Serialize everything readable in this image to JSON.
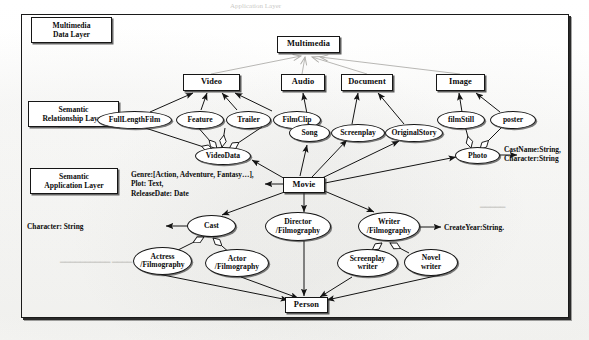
{
  "diagram": {
    "layers": [
      {
        "id": "data",
        "label": "Multimedia\nData Layer"
      },
      {
        "id": "relationship",
        "label": "Semantic\nRelationship Layer"
      },
      {
        "id": "application",
        "label": "Semantic\nApplication Layer"
      }
    ],
    "nodes": {
      "multimedia": {
        "label": "Multimedia",
        "shape": "box"
      },
      "video": {
        "label": "Video",
        "shape": "box"
      },
      "audio": {
        "label": "Audio",
        "shape": "box"
      },
      "document": {
        "label": "Document",
        "shape": "box"
      },
      "image": {
        "label": "Image",
        "shape": "box"
      },
      "fulllengthfilm": {
        "label": "FullLengthFilm",
        "shape": "ellipse"
      },
      "feature": {
        "label": "Feature",
        "shape": "ellipse"
      },
      "trailer": {
        "label": "Trailer",
        "shape": "ellipse"
      },
      "filmclip": {
        "label": "FilmClip",
        "shape": "ellipse"
      },
      "song": {
        "label": "Song",
        "shape": "ellipse"
      },
      "screenplay": {
        "label": "Screenplay",
        "shape": "ellipse"
      },
      "originalstory": {
        "label": "OriginalStory",
        "shape": "ellipse"
      },
      "filmstill": {
        "label": "filmStill",
        "shape": "ellipse"
      },
      "poster": {
        "label": "poster",
        "shape": "ellipse"
      },
      "videodata": {
        "label": "VideoData",
        "shape": "ellipse"
      },
      "photo": {
        "label": "Photo",
        "shape": "ellipse"
      },
      "movie": {
        "label": "Movie",
        "shape": "box"
      },
      "cast": {
        "label": "Cast",
        "shape": "ellipse"
      },
      "director": {
        "label": "Director\n/Filmography",
        "shape": "ellipse"
      },
      "writer": {
        "label": "Writer\n/Filmography",
        "shape": "ellipse"
      },
      "actress": {
        "label": "Actress\n/Filmography",
        "shape": "ellipse"
      },
      "actor": {
        "label": "Actor\n/Filmography",
        "shape": "ellipse"
      },
      "screenplaywriter": {
        "label": "Screenplay\nwriter",
        "shape": "ellipse"
      },
      "novelwriter": {
        "label": "Novel\nwriter",
        "shape": "ellipse"
      },
      "person": {
        "label": "Person",
        "shape": "box"
      }
    },
    "attributes": {
      "movie": {
        "label": "Genre:[Action, Adventure, Fantasy…],\nPlot: Text,\nReleaseDate: Date"
      },
      "cast": {
        "label": "Character: String"
      },
      "photo": {
        "label": "CastName:String,\nCharacter:String"
      },
      "writer": {
        "label": "CreateYear:String."
      }
    },
    "edges": [
      {
        "from": "video",
        "to": "multimedia",
        "kind": "generalization"
      },
      {
        "from": "audio",
        "to": "multimedia",
        "kind": "generalization"
      },
      {
        "from": "document",
        "to": "multimedia",
        "kind": "generalization"
      },
      {
        "from": "image",
        "to": "multimedia",
        "kind": "generalization"
      },
      {
        "from": "fulllengthfilm",
        "to": "video",
        "kind": "association"
      },
      {
        "from": "feature",
        "to": "video",
        "kind": "association"
      },
      {
        "from": "trailer",
        "to": "video",
        "kind": "association"
      },
      {
        "from": "filmclip",
        "to": "video",
        "kind": "association"
      },
      {
        "from": "song",
        "to": "audio",
        "kind": "association"
      },
      {
        "from": "screenplay",
        "to": "document",
        "kind": "association"
      },
      {
        "from": "originalstory",
        "to": "document",
        "kind": "association"
      },
      {
        "from": "filmstill",
        "to": "image",
        "kind": "association"
      },
      {
        "from": "poster",
        "to": "image",
        "kind": "association"
      },
      {
        "from": "fulllengthfilm",
        "to": "videodata",
        "kind": "aggregation"
      },
      {
        "from": "feature",
        "to": "videodata",
        "kind": "aggregation"
      },
      {
        "from": "trailer",
        "to": "videodata",
        "kind": "aggregation"
      },
      {
        "from": "filmclip",
        "to": "videodata",
        "kind": "aggregation"
      },
      {
        "from": "filmstill",
        "to": "photo",
        "kind": "aggregation"
      },
      {
        "from": "poster",
        "to": "photo",
        "kind": "aggregation"
      },
      {
        "from": "movie",
        "to": "videodata",
        "kind": "association"
      },
      {
        "from": "movie",
        "to": "song",
        "kind": "association"
      },
      {
        "from": "movie",
        "to": "screenplay",
        "kind": "association"
      },
      {
        "from": "movie",
        "to": "originalstory",
        "kind": "association"
      },
      {
        "from": "movie",
        "to": "photo",
        "kind": "association"
      },
      {
        "from": "movie",
        "to": "cast",
        "kind": "association"
      },
      {
        "from": "movie",
        "to": "director",
        "kind": "association"
      },
      {
        "from": "movie",
        "to": "writer",
        "kind": "association"
      },
      {
        "from": "actress",
        "to": "cast",
        "kind": "aggregation"
      },
      {
        "from": "actor",
        "to": "cast",
        "kind": "aggregation"
      },
      {
        "from": "screenplaywriter",
        "to": "writer",
        "kind": "aggregation"
      },
      {
        "from": "novelwriter",
        "to": "writer",
        "kind": "aggregation"
      },
      {
        "from": "actress",
        "to": "person",
        "kind": "association"
      },
      {
        "from": "actor",
        "to": "person",
        "kind": "association"
      },
      {
        "from": "director",
        "to": "person",
        "kind": "association"
      },
      {
        "from": "screenplaywriter",
        "to": "person",
        "kind": "association"
      },
      {
        "from": "novelwriter",
        "to": "person",
        "kind": "association"
      }
    ],
    "colors": {
      "stroke": "#161616",
      "page": "#fbfbfa",
      "generalization_stroke": "#a9a8a4"
    }
  }
}
